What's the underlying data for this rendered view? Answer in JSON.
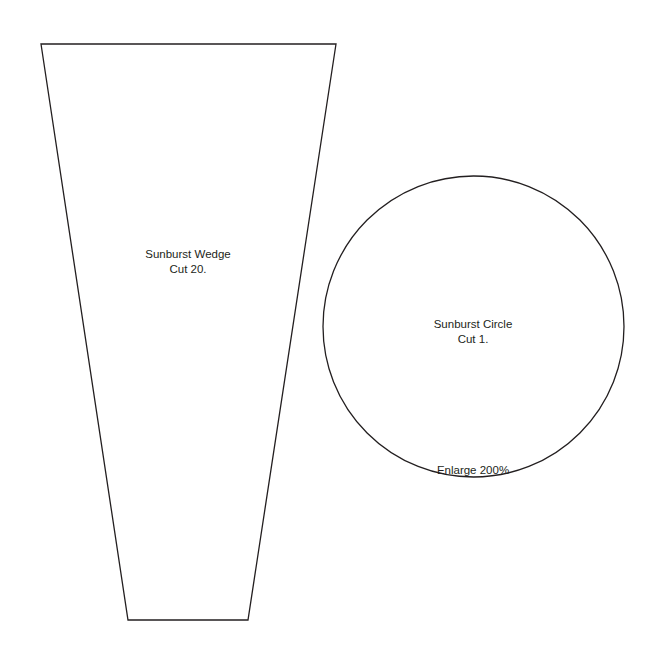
{
  "pattern": {
    "wedge": {
      "name": "Sunburst Wedge",
      "instruction": "Cut 20."
    },
    "circle": {
      "name": "Sunburst Circle",
      "instruction": "Cut 1.",
      "note": "Enlarge 200%"
    }
  },
  "colors": {
    "line": "#231f20",
    "text": "#231f20",
    "background": "#ffffff"
  }
}
